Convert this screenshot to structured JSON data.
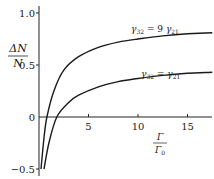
{
  "chart_data": {
    "type": "line",
    "title": "",
    "xlabel": "Γ/Γ0",
    "xlabel_num": "Γ",
    "xlabel_den": "Γ0",
    "ylabel": "ΔN/N",
    "ylabel_num": "ΔN",
    "ylabel_den": "N",
    "xlim": [
      0,
      17.5
    ],
    "ylim": [
      -0.5,
      1.05
    ],
    "x_ticks": [
      5,
      10,
      15
    ],
    "x_tick_labels": [
      "5",
      "10",
      "15"
    ],
    "y_ticks": [
      1.0,
      0.5,
      0,
      -0.5
    ],
    "y_tick_labels": [
      "1.0",
      "0.5",
      "0",
      "−0.5"
    ],
    "grid": false,
    "legend": "inline curve labels",
    "series": [
      {
        "name": "γ32 = 9 γ21",
        "label_main": "γ",
        "label_sub1": "32",
        "label_eq": " = 9 ",
        "label_main2": "γ",
        "label_sub2": "21",
        "x": [
          0.2,
          0.5,
          0.8,
          1.5,
          2.5,
          4,
          6,
          8,
          10,
          12.5,
          15,
          17.5
        ],
        "values": [
          -0.5,
          -0.2,
          0.0,
          0.25,
          0.45,
          0.58,
          0.67,
          0.72,
          0.75,
          0.78,
          0.8,
          0.81
        ]
      },
      {
        "name": "γ32 = γ21",
        "label_main": "γ",
        "label_sub1": "32",
        "label_eq": " = ",
        "label_main2": "γ",
        "label_sub2": "21",
        "x": [
          0.5,
          1.0,
          1.8,
          3,
          4,
          6,
          8,
          10,
          12.5,
          15,
          17.5
        ],
        "values": [
          -0.5,
          -0.25,
          0.0,
          0.14,
          0.21,
          0.29,
          0.34,
          0.37,
          0.4,
          0.42,
          0.43
        ]
      }
    ]
  }
}
